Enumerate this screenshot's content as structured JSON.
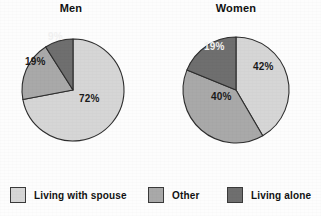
{
  "figure": {
    "background_color": "#fdfdfd",
    "charts": [
      {
        "id": "men",
        "title": "Men",
        "center": [
          71,
          88
        ],
        "radius": 51,
        "labels": {
          "living_with_spouse": "72%",
          "other": "19%",
          "living_alone": "9%"
        }
      },
      {
        "id": "women",
        "title": "Women",
        "center": [
          236,
          90
        ],
        "radius": 53,
        "labels": {
          "living_with_spouse": "42%",
          "other": "40%",
          "living_alone": "19%"
        }
      }
    ]
  },
  "legend": {
    "position": "bottom",
    "items": [
      {
        "label": "Living  with spouse",
        "color": "#d6d6d6",
        "key": "living_with_spouse"
      },
      {
        "label": "Other",
        "color": "#a9a9a9",
        "key": "other"
      },
      {
        "label": "Living alone",
        "color": "#6f6f6f",
        "key": "living_alone"
      }
    ]
  },
  "colors": {
    "living_with_spouse": "#d6d6d6",
    "other": "#a9a9a9",
    "living_alone": "#6f6f6f",
    "outline": "#2e2e2e",
    "text": "#121212",
    "text_on_dark": "#f2f2f2"
  },
  "chart_data": {
    "type": "pie",
    "charts": [
      {
        "type": "pie",
        "title": "Men",
        "categories": [
          "Living with spouse",
          "Other",
          "Living alone"
        ],
        "values": [
          72,
          19,
          9
        ],
        "value_labels": [
          "72%",
          "19%",
          "9%"
        ],
        "colors": [
          "#d6d6d6",
          "#a9a9a9",
          "#6f6f6f"
        ],
        "start_angle_deg": 0,
        "direction": "clockwise",
        "units": "percent"
      },
      {
        "type": "pie",
        "title": "Women",
        "categories": [
          "Living with spouse",
          "Other",
          "Living alone"
        ],
        "values": [
          42,
          40,
          19
        ],
        "value_labels": [
          "42%",
          "40%",
          "19%"
        ],
        "colors": [
          "#d6d6d6",
          "#a9a9a9",
          "#6f6f6f"
        ],
        "start_angle_deg": 0,
        "direction": "clockwise",
        "units": "percent"
      }
    ],
    "legend": [
      "Living  with spouse",
      "Other",
      "Living alone"
    ],
    "legend_position": "bottom",
    "xlabel": "",
    "ylabel": "",
    "grid": false
  }
}
